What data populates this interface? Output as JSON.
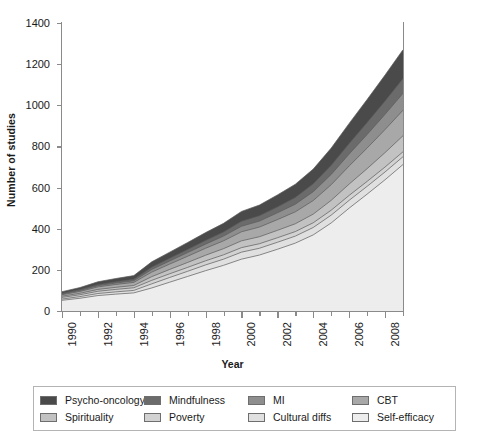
{
  "chart_data": {
    "type": "area",
    "stacked": true,
    "title": "",
    "subtitle": "",
    "xlabel": "Year",
    "ylabel": "Number of studies",
    "xlim": [
      1990,
      2009
    ],
    "ylim": [
      0,
      1400
    ],
    "yticks": [
      0,
      200,
      400,
      600,
      800,
      1000,
      1200,
      1400
    ],
    "ytick_labels": [
      "0",
      "200",
      "400",
      "600",
      "800",
      "1000",
      "1200",
      "1400"
    ],
    "xticks_major": [
      1990,
      1992,
      1994,
      1996,
      1998,
      2000,
      2002,
      2004,
      2006,
      2008
    ],
    "xtick_labels": [
      "1990",
      "1992",
      "1994",
      "1996",
      "1998",
      "2000",
      "2002",
      "2004",
      "2006",
      "2008"
    ],
    "xticks_minor": [
      1991,
      1993,
      1995,
      1997,
      1999,
      2001,
      2003,
      2005,
      2007,
      2009
    ],
    "grid": false,
    "legend_position": "bottom",
    "legend_columns": 4,
    "legend_rows": 2,
    "x": [
      1990,
      1991,
      1992,
      1993,
      1994,
      1995,
      1996,
      1997,
      1998,
      1999,
      2000,
      2001,
      2002,
      2003,
      2004,
      2005,
      2006,
      2007,
      2008,
      2009
    ],
    "stack_order_bottom_to_top": [
      "Self-efficacy",
      "Cultural diffs",
      "Poverty",
      "Spirituality",
      "CBT",
      "MI",
      "Mindfulness",
      "Psycho-oncology"
    ],
    "series": [
      {
        "name": "Self-efficacy",
        "color": "#ededed",
        "values": [
          52,
          62,
          75,
          82,
          88,
          112,
          140,
          168,
          196,
          222,
          252,
          272,
          300,
          330,
          370,
          428,
          500,
          568,
          638,
          712
        ]
      },
      {
        "name": "Cultural diffs",
        "color": "#e0e0e0",
        "values": [
          6,
          8,
          10,
          11,
          12,
          20,
          23,
          25,
          28,
          30,
          34,
          33,
          34,
          34,
          36,
          38,
          38,
          38,
          38,
          38
        ]
      },
      {
        "name": "Poverty",
        "color": "#d2d2d2",
        "values": [
          8,
          9,
          11,
          12,
          13,
          17,
          18,
          19,
          20,
          21,
          22,
          22,
          22,
          22,
          23,
          24,
          24,
          24,
          24,
          24
        ]
      },
      {
        "name": "Spirituality",
        "color": "#c2c2c2",
        "values": [
          6,
          7,
          9,
          10,
          11,
          18,
          21,
          24,
          27,
          30,
          33,
          34,
          36,
          38,
          42,
          48,
          55,
          62,
          70,
          78
        ]
      },
      {
        "name": "CBT",
        "color": "#a8a8a8",
        "values": [
          7,
          9,
          12,
          14,
          15,
          22,
          26,
          30,
          34,
          38,
          44,
          47,
          52,
          58,
          66,
          76,
          88,
          100,
          112,
          124
        ]
      },
      {
        "name": "MI",
        "color": "#8e8e8e",
        "values": [
          4,
          5,
          6,
          7,
          8,
          13,
          15,
          18,
          20,
          23,
          27,
          29,
          33,
          37,
          43,
          50,
          58,
          66,
          74,
          82
        ]
      },
      {
        "name": "Mindfulness",
        "color": "#6b6b6b",
        "values": [
          3,
          4,
          5,
          6,
          7,
          11,
          13,
          15,
          18,
          20,
          24,
          26,
          29,
          33,
          38,
          44,
          51,
          58,
          65,
          72
        ]
      },
      {
        "name": "Psycho-oncology",
        "color": "#4a4a4a",
        "values": [
          8,
          10,
          14,
          16,
          18,
          26,
          30,
          34,
          38,
          42,
          48,
          52,
          58,
          64,
          72,
          84,
          98,
          112,
          126,
          140
        ]
      }
    ],
    "totals": [
      94,
      114,
      142,
      158,
      172,
      239,
      286,
      333,
      381,
      426,
      484,
      515,
      564,
      616,
      690,
      792,
      912,
      1028,
      1147,
      1270
    ],
    "annotations": []
  },
  "legend": {
    "items": [
      {
        "label": "Psycho-oncology",
        "color": "#4a4a4a"
      },
      {
        "label": "Mindfulness",
        "color": "#6b6b6b"
      },
      {
        "label": "MI",
        "color": "#8e8e8e"
      },
      {
        "label": "CBT",
        "color": "#a8a8a8"
      },
      {
        "label": "Spirituality",
        "color": "#c2c2c2"
      },
      {
        "label": "Poverty",
        "color": "#d2d2d2"
      },
      {
        "label": "Cultural diffs",
        "color": "#e0e0e0"
      },
      {
        "label": "Self-efficacy",
        "color": "#ededed"
      }
    ]
  },
  "style": {
    "axis_color": "#8a8a8a",
    "line_color": "#5a5a5a",
    "text_color": "#1a1a1a",
    "background": "#ffffff"
  }
}
